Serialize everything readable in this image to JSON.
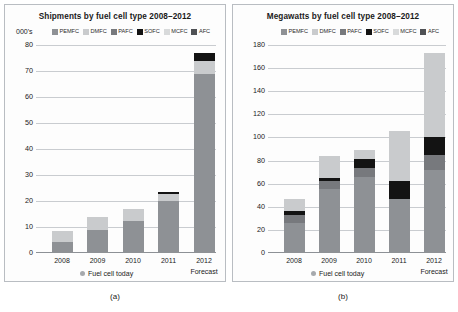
{
  "figure": {
    "panels": [
      {
        "caption": "(a)",
        "title": "Shipments by fuel cell type 2008–2012",
        "units_label": "000's",
        "today_label": "Fuel cell today",
        "forecast_label": "Forecast"
      },
      {
        "caption": "(b)",
        "title": "Megawatts by fuel cell type 2008–2012",
        "units_label": "",
        "today_label": "Fuel cell today",
        "forecast_label": "Forecast"
      }
    ]
  },
  "legend": {
    "entries": [
      {
        "label": "PEMFC",
        "color": "#8e9195"
      },
      {
        "label": "DMFC",
        "color": "#c9cbcd"
      },
      {
        "label": "PAFC",
        "color": "#77797d"
      },
      {
        "label": "SOFC",
        "color": "#131313"
      },
      {
        "label": "MCFC",
        "color": "#d8dadb"
      },
      {
        "label": "AFC",
        "color": "#4f5155"
      }
    ]
  },
  "chart_data": [
    {
      "type": "bar",
      "stacked": true,
      "title": "Shipments by fuel cell type 2008–2012",
      "xlabel": "",
      "ylabel": "000's",
      "ylim": [
        0,
        80
      ],
      "yticks": [
        0,
        10,
        20,
        30,
        40,
        50,
        60,
        70,
        80
      ],
      "grid": true,
      "legend_position": "top",
      "categories": [
        "2008",
        "2009",
        "2010",
        "2011",
        "2012"
      ],
      "annotations": [
        "Fuel cell today",
        "Forecast"
      ],
      "series": [
        {
          "name": "PEMFC",
          "color": "#8e9195",
          "values": [
            4.2,
            9.0,
            12.5,
            20.0,
            69.0
          ]
        },
        {
          "name": "DMFC",
          "color": "#c9cbcd",
          "values": [
            4.3,
            5.0,
            4.5,
            2.6,
            5.0
          ]
        },
        {
          "name": "PAFC",
          "color": "#77797d",
          "values": [
            0,
            0,
            0,
            0,
            0
          ]
        },
        {
          "name": "SOFC",
          "color": "#131313",
          "values": [
            0,
            0,
            0,
            0.7,
            3.0
          ]
        },
        {
          "name": "MCFC",
          "color": "#d8dadb",
          "values": [
            0,
            0,
            0,
            0,
            0
          ]
        },
        {
          "name": "AFC",
          "color": "#4f5155",
          "values": [
            0,
            0,
            0,
            0,
            0
          ]
        }
      ],
      "totals": [
        8.5,
        14.0,
        17.0,
        23.3,
        77.0
      ]
    },
    {
      "type": "bar",
      "stacked": true,
      "title": "Megawatts by fuel cell type 2008–2012",
      "xlabel": "",
      "ylabel": "",
      "ylim": [
        0,
        180
      ],
      "yticks": [
        0,
        20,
        40,
        60,
        80,
        100,
        120,
        140,
        160,
        180
      ],
      "grid": true,
      "legend_position": "top",
      "categories": [
        "2008",
        "2009",
        "2010",
        "2011",
        "2012"
      ],
      "annotations": [
        "Fuel cell today",
        "Forecast"
      ],
      "series": [
        {
          "name": "PEMFC",
          "color": "#8e9195",
          "values": [
            26.0,
            55.0,
            66.0,
            47.0,
            72.0
          ]
        },
        {
          "name": "PAFC",
          "color": "#77797d",
          "values": [
            7.0,
            7.0,
            8.0,
            0.0,
            13.0
          ]
        },
        {
          "name": "SOFC",
          "color": "#131313",
          "values": [
            3.0,
            3.0,
            7.0,
            15.0,
            15.0
          ]
        },
        {
          "name": "DMFC",
          "color": "#c9cbcd",
          "values": [
            11.0,
            19.0,
            8.0,
            44.0,
            73.0
          ]
        }
      ],
      "totals": [
        47.0,
        84.0,
        89.0,
        106.0,
        173.0
      ]
    }
  ]
}
